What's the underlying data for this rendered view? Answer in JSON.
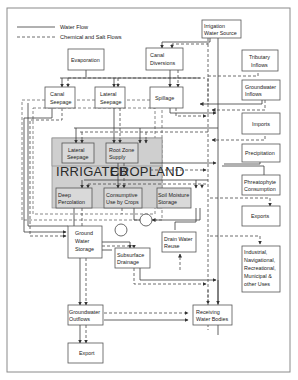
{
  "legend": {
    "water_flow": "Water Flow",
    "chemical_flow": "Chemical and Salt Flows"
  },
  "cropland_label": {
    "left": "IRRIGATED",
    "right": "CROPLAND"
  },
  "nodes": {
    "irrigation_source": [
      "Irrigation",
      "Water Source"
    ],
    "evaporation": [
      "Evaporation"
    ],
    "canal_diversions": [
      "Canal",
      "Diversions"
    ],
    "tributary_inflows": [
      "Tributary",
      "Inflows"
    ],
    "canal_seepage": [
      "Canal",
      "Seepage"
    ],
    "lateral_seepage_top": [
      "Lateral",
      "Seepage"
    ],
    "spillage": [
      "Spillage"
    ],
    "groundwater_inflows": [
      "Groundwater",
      "Inflows"
    ],
    "imports": [
      "Imports"
    ],
    "lateral_seepage": [
      "Lateral",
      "Seepage"
    ],
    "root_zone_supply": [
      "Root Zone",
      "Supply"
    ],
    "field_tailwater": [
      "Field",
      "Tailwater"
    ],
    "precipitation": [
      "Precipitation"
    ],
    "phreatophyte": [
      "Phreatophyte",
      "Consumption"
    ],
    "deep_percolation": [
      "Deep",
      "Percolation"
    ],
    "consumptive_use": [
      "Consumptive",
      "Use by Crops"
    ],
    "soil_moisture": [
      "Soil Moisture",
      "Storage"
    ],
    "exports": [
      "Exports"
    ],
    "ground_water_storage": [
      "Ground",
      "Water",
      "Storage"
    ],
    "drain_water_reuse": [
      "Drain Water",
      "Reuse"
    ],
    "subsurface_drainage": [
      "Subsurface",
      "Drainage"
    ],
    "industrial_uses": [
      "Industrial,",
      "Navigational,",
      "Recreational,",
      "Municipal &",
      "other Uses"
    ],
    "groundwater_outflows": [
      "Groundwater",
      "Outflows"
    ],
    "receiving_water_bodies": [
      "Receiving",
      "Water Bodies"
    ],
    "export": [
      "Export"
    ]
  },
  "colors": {
    "cropland_fill": "#cfcfcf",
    "inner_box_fill": "#d9d9d9",
    "line": "#3a3a3a",
    "frame": "#8a8a8a"
  }
}
